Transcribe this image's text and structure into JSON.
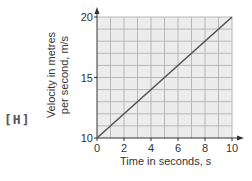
{
  "label_tag": "[H]",
  "chart_data": {
    "type": "line",
    "title": "",
    "xlabel": "Time in seconds, s",
    "ylabel_line1": "Velocity in metres",
    "ylabel_line2": "per second, m/s",
    "xlim": [
      0,
      10
    ],
    "ylim": [
      10,
      20
    ],
    "x_ticks": [
      "0",
      "2",
      "4",
      "6",
      "8",
      "10"
    ],
    "y_ticks": [
      "10",
      "15",
      "20"
    ],
    "grid": true,
    "grid_step_x": 1,
    "grid_step_y": 1,
    "series": [
      {
        "name": "velocity",
        "x": [
          0,
          10
        ],
        "y": [
          10,
          20
        ],
        "color": "#555555"
      }
    ],
    "colors": {
      "plot_bg": "#ececec",
      "grid": "#b8b8b8",
      "axis": "#333333",
      "line": "#555555"
    }
  }
}
